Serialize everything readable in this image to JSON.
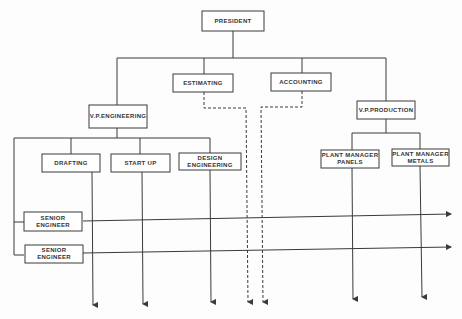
{
  "diagram": {
    "type": "organization-chart",
    "nodes": {
      "president": "PRESIDENT",
      "vp_engineering": "V.P.ENGINEERING",
      "estimating": "ESTIMATING",
      "accounting": "ACCOUNTING",
      "vp_production": "V.P.PRODUCTION",
      "drafting": "DRAFTING",
      "start_up": "START UP",
      "design_engineering": "DESIGN\nENGINEERING",
      "plant_manager_panels": "PLANT MANAGER\nPANELS",
      "plant_manager_metals": "PLANT MANAGER\nMETALS",
      "senior_engineer_1": "SENIOR\nENGINEER",
      "senior_engineer_2": "SENIOR\nENGINEER"
    },
    "edges": [
      {
        "from": "president",
        "to": "vp_engineering",
        "style": "solid"
      },
      {
        "from": "president",
        "to": "estimating",
        "style": "solid"
      },
      {
        "from": "president",
        "to": "accounting",
        "style": "solid"
      },
      {
        "from": "president",
        "to": "vp_production",
        "style": "solid"
      },
      {
        "from": "vp_engineering",
        "to": "drafting",
        "style": "solid"
      },
      {
        "from": "vp_engineering",
        "to": "start_up",
        "style": "solid"
      },
      {
        "from": "vp_engineering",
        "to": "design_engineering",
        "style": "solid"
      },
      {
        "from": "vp_engineering",
        "to": "senior_engineer_1",
        "style": "solid"
      },
      {
        "from": "vp_engineering",
        "to": "senior_engineer_2",
        "style": "solid"
      },
      {
        "from": "vp_production",
        "to": "plant_manager_panels",
        "style": "solid"
      },
      {
        "from": "vp_production",
        "to": "plant_manager_metals",
        "style": "solid"
      },
      {
        "from": "estimating",
        "to": "downstream",
        "style": "dashed"
      },
      {
        "from": "accounting",
        "to": "downstream",
        "style": "dashed"
      }
    ],
    "line_color": "#3a3a3a"
  }
}
